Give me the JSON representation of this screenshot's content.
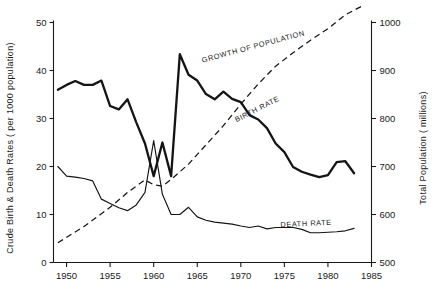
{
  "chart_data": {
    "type": "line",
    "title": "",
    "xlabel": "",
    "ylabel": "Crude Birth & Death Rates  ( per 1000  population)",
    "y2label": "Total Population  ( millions)",
    "xlim": [
      1948.5,
      1985
    ],
    "ylim": [
      0,
      50
    ],
    "y2lim": [
      500,
      1000
    ],
    "grid": false,
    "legend_position": "inline-annotations",
    "xticks": [
      1950,
      1955,
      1960,
      1965,
      1970,
      1975,
      1980,
      1985
    ],
    "xticklabels": [
      "1950",
      "1955",
      "1960",
      "1965",
      "1970",
      "1975",
      "1980",
      "1985"
    ],
    "yticks": [
      0,
      10,
      20,
      30,
      40,
      50
    ],
    "yticklabels": [
      "0",
      "10",
      "20",
      "30",
      "40",
      "50"
    ],
    "y2ticks": [
      500,
      600,
      700,
      800,
      900,
      1000
    ],
    "y2ticklabels": [
      "500",
      "600",
      "700",
      "800",
      "900",
      "1000"
    ],
    "annotations": [
      {
        "text": "GROWTH  OF  POPULATION",
        "x": 1971.5,
        "y": 44.5,
        "rotation": -15
      },
      {
        "text": "BIRTH  RATE",
        "x": 1972.0,
        "y": 31.5,
        "rotation": -27
      },
      {
        "text": "DEATH  RATE",
        "x": 1977.5,
        "y": 7.6,
        "rotation": -3
      }
    ],
    "series": [
      {
        "name": "BIRTH  RATE",
        "style": "solid-thick",
        "axis": "left",
        "x": [
          1949,
          1950,
          1951,
          1952,
          1953,
          1954,
          1955,
          1956,
          1957,
          1958,
          1959,
          1960,
          1961,
          1962,
          1963,
          1964,
          1965,
          1966,
          1967,
          1968,
          1969,
          1970,
          1971,
          1972,
          1973,
          1974,
          1975,
          1976,
          1977,
          1978,
          1979,
          1980,
          1981,
          1982,
          1983
        ],
        "values": [
          36.0,
          37.0,
          37.8,
          37.0,
          37.0,
          37.9,
          32.6,
          31.9,
          34.0,
          29.2,
          24.8,
          18.0,
          25.0,
          18.0,
          43.4,
          39.1,
          37.9,
          35.1,
          34.0,
          35.6,
          34.1,
          33.4,
          30.7,
          29.8,
          28.0,
          24.8,
          23.0,
          19.9,
          18.9,
          18.3,
          17.8,
          18.2,
          20.9,
          21.1,
          18.6
        ]
      },
      {
        "name": "DEATH  RATE",
        "style": "solid-thin",
        "axis": "left",
        "x": [
          1949,
          1950,
          1951,
          1952,
          1953,
          1954,
          1955,
          1956,
          1957,
          1958,
          1959,
          1960,
          1961,
          1962,
          1963,
          1964,
          1965,
          1966,
          1967,
          1968,
          1969,
          1970,
          1971,
          1972,
          1973,
          1974,
          1975,
          1976,
          1977,
          1978,
          1979,
          1980,
          1981,
          1982,
          1983
        ],
        "values": [
          20.0,
          18.0,
          17.8,
          17.5,
          17.0,
          13.2,
          12.3,
          11.4,
          10.8,
          12.0,
          14.6,
          25.4,
          14.2,
          10.0,
          10.0,
          11.5,
          9.5,
          8.8,
          8.4,
          8.2,
          8.0,
          7.6,
          7.3,
          7.6,
          7.0,
          7.3,
          7.3,
          7.3,
          6.9,
          6.2,
          6.2,
          6.3,
          6.4,
          6.6,
          7.1
        ]
      },
      {
        "name": "GROWTH  OF  POPULATION",
        "style": "dashed",
        "axis": "right",
        "x": [
          1949,
          1952,
          1955,
          1957,
          1959,
          1960,
          1961,
          1962,
          1964,
          1966,
          1968,
          1970,
          1972,
          1974,
          1976,
          1978,
          1980,
          1982,
          1984
        ],
        "values": [
          541,
          575,
          615,
          646,
          672,
          662,
          659,
          673,
          705,
          745,
          785,
          830,
          872,
          909,
          937,
          963,
          987,
          1016,
          1035
        ]
      }
    ]
  },
  "axes": {
    "left_title": "Crude Birth & Death Rates  ( per 1000  population)",
    "right_title": "Total Population  ( millions)"
  }
}
